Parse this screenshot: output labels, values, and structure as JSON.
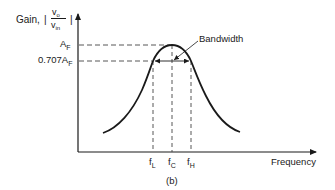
{
  "figure": {
    "caption": "(b)",
    "y_axis_label": {
      "prefix": "Gain,",
      "abs_open": "|",
      "abs_close": "|",
      "numerator": "v",
      "numerator_sub": "o",
      "denominator": "v",
      "denominator_sub": "in"
    },
    "x_axis_label": "Frequency",
    "y_ticks": [
      {
        "main": "A",
        "sub": "F"
      },
      {
        "main": "0.707A",
        "sub": "F"
      }
    ],
    "x_ticks": [
      {
        "main": "f",
        "sub": "L"
      },
      {
        "main": "f",
        "sub": "C"
      },
      {
        "main": "f",
        "sub": "H"
      }
    ],
    "annotation": "Bandwidth"
  },
  "colors": {
    "curve": "#1a1a1a",
    "axis": "#1a1a1a",
    "dashed": "#444444",
    "background": "#ffffff"
  }
}
